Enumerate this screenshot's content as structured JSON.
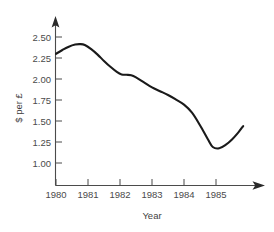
{
  "chart_data": {
    "type": "line",
    "title": "",
    "subtitle": "",
    "xlabel": "Year",
    "ylabel": "$ per £",
    "xlim": [
      1980,
      1985.85
    ],
    "ylim": [
      0.88,
      2.62
    ],
    "grid": false,
    "legend": null,
    "x_ticks": [
      "1980",
      "1981",
      "1982",
      "1983",
      "1984",
      "1985"
    ],
    "x_tick_values": [
      1980,
      1981,
      1982,
      1983,
      1984,
      1985
    ],
    "y_ticks": [
      "1.00",
      "1.25",
      "1.50",
      "1.75",
      "2.00",
      "2.25",
      "2.50"
    ],
    "y_tick_values": [
      1.0,
      1.25,
      1.5,
      1.75,
      2.0,
      2.25,
      2.5
    ],
    "series": [
      {
        "name": "$ per £",
        "color": "#1a1a1a",
        "x": [
          1980.0,
          1980.2,
          1980.4,
          1980.6,
          1980.75,
          1980.9,
          1981.1,
          1981.3,
          1981.5,
          1981.7,
          1981.9,
          1982.05,
          1982.2,
          1982.35,
          1982.5,
          1982.75,
          1983.0,
          1983.25,
          1983.5,
          1983.75,
          1984.0,
          1984.25,
          1984.5,
          1984.75,
          1984.9,
          1985.1,
          1985.3,
          1985.5,
          1985.7,
          1985.85
        ],
        "values": [
          2.3,
          2.345,
          2.385,
          2.41,
          2.415,
          2.405,
          2.355,
          2.29,
          2.215,
          2.145,
          2.085,
          2.055,
          2.05,
          2.045,
          2.02,
          1.96,
          1.9,
          1.855,
          1.81,
          1.755,
          1.695,
          1.6,
          1.45,
          1.28,
          1.19,
          1.175,
          1.215,
          1.28,
          1.365,
          1.44
        ]
      }
    ],
    "annotations": {
      "peak_value": 2.42,
      "peak_x": "1980.75",
      "minimum_value": 1.17,
      "minimum_x": "1984.95",
      "start_value": 2.3,
      "end_value": 1.44
    },
    "axes_style": {
      "x_axis_arrow": true,
      "y_axis_arrow": true,
      "axis_color": "#4b4b4b",
      "background": "#ffffff"
    }
  }
}
